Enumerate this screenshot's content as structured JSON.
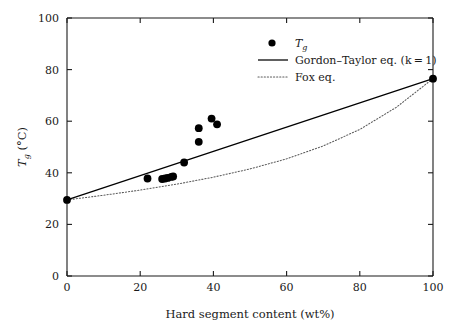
{
  "chart_data": {
    "type": "scatter",
    "title": "",
    "xlabel": "Hard segment content (wt%)",
    "ylabel": "T_g (°C)",
    "ylabel_parts": {
      "symbol": "T",
      "subscript": "g",
      "units": "(°C)"
    },
    "xlim": [
      0,
      100
    ],
    "ylim": [
      0,
      100
    ],
    "xticks": [
      0,
      20,
      40,
      60,
      80,
      100
    ],
    "yticks": [
      0,
      20,
      40,
      60,
      80,
      100
    ],
    "xtick_labels": [
      "0",
      "20",
      "40",
      "60",
      "80",
      "100"
    ],
    "ytick_labels": [
      "0",
      "20",
      "40",
      "60",
      "80",
      "100"
    ],
    "grid": false,
    "legend_position": "upper-right",
    "series": [
      {
        "name": "Tg",
        "legend_label_symbol": "T",
        "legend_label_subscript": "g",
        "type": "scatter",
        "marker": "filled-circle",
        "color": "#000000",
        "points": [
          {
            "x": 0,
            "y": 29.5
          },
          {
            "x": 22,
            "y": 37.8
          },
          {
            "x": 26,
            "y": 37.6
          },
          {
            "x": 26.8,
            "y": 37.8
          },
          {
            "x": 27.5,
            "y": 38.0
          },
          {
            "x": 28.5,
            "y": 38.4
          },
          {
            "x": 29,
            "y": 38.6
          },
          {
            "x": 32,
            "y": 44.0
          },
          {
            "x": 36,
            "y": 52.0
          },
          {
            "x": 36,
            "y": 57.3
          },
          {
            "x": 39.5,
            "y": 61.0
          },
          {
            "x": 41,
            "y": 58.8
          },
          {
            "x": 100,
            "y": 76.5
          }
        ]
      },
      {
        "name": "Gordon-Taylor eq. (k = 1)",
        "legend_label": "Gordon–Taylor eq. (k = 1)",
        "type": "line",
        "style": "solid",
        "color": "#000000",
        "x": [
          0,
          100
        ],
        "y": [
          29.5,
          76.5
        ]
      },
      {
        "name": "Fox eq.",
        "legend_label": "Fox eq.",
        "type": "line",
        "style": "dotted",
        "color": "#4d4d4d",
        "x": [
          0,
          10,
          20,
          30,
          40,
          50,
          60,
          70,
          80,
          90,
          100
        ],
        "y": [
          29.5,
          31.3,
          33.3,
          35.6,
          38.3,
          41.5,
          45.4,
          50.4,
          56.8,
          65.4,
          76.5
        ]
      }
    ]
  },
  "legend": {
    "items": [
      {
        "label": "T",
        "sub": "g",
        "kind": "marker"
      },
      {
        "label": "Gordon–Taylor eq. (k = 1)",
        "kind": "solid-line"
      },
      {
        "label": "Fox eq.",
        "kind": "dotted-line"
      }
    ]
  },
  "colors": {
    "axis": "#1a1a1a",
    "marker": "#000000",
    "solid_line": "#000000",
    "dotted_line": "#5a5a5a",
    "background": "#ffffff"
  }
}
